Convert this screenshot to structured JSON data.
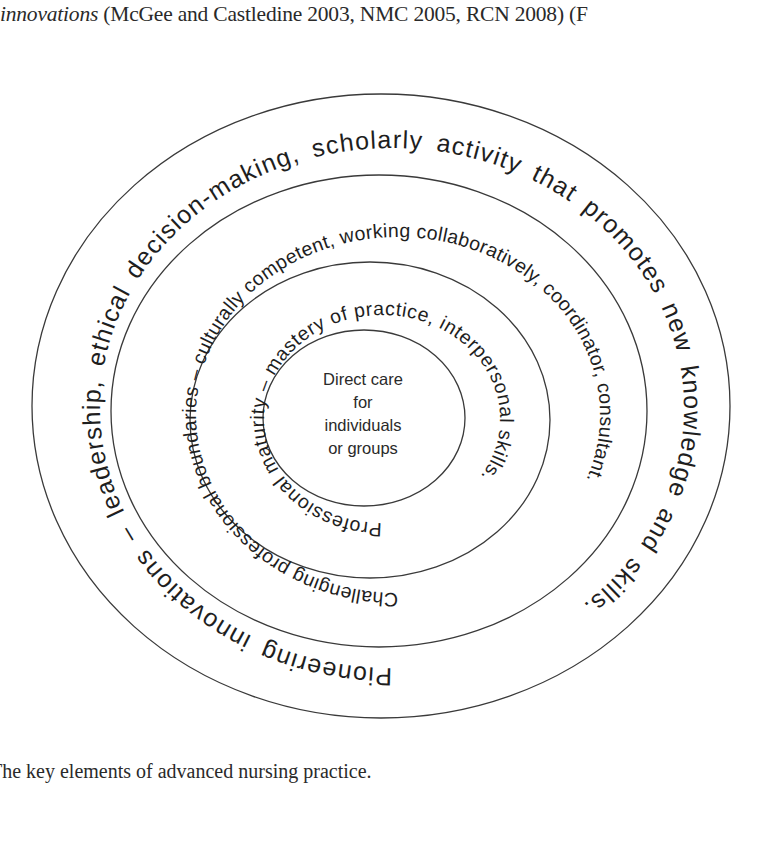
{
  "document": {
    "intro_line": {
      "italic": "innovations",
      "rest": " (McGee and Castledine 2003, NMC 2005, RCN 2008) (F"
    },
    "caption": "The key elements of advanced nursing practice."
  },
  "diagram": {
    "type": "concentric-ellipses",
    "core": {
      "lines": [
        "Direct care",
        "for",
        "individuals",
        "or groups"
      ]
    },
    "rings": {
      "inner": "Professional maturity – mastery of practice, interpersonal skills.",
      "middle": "Challenging professional boundaries – culturally competent, working collaboratively, coordinator, consultant.",
      "outer": "Pioneering innovations – leadership, ethical decision-making, scholarly activity that promotes new knowledge and skills."
    },
    "colors": {
      "stroke": "#3a3a3a",
      "text": "#1e1e1e",
      "background": "#ffffff"
    }
  }
}
